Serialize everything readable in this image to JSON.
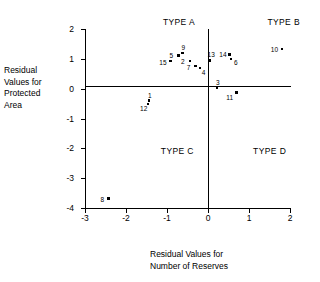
{
  "chart_data": {
    "type": "scatter",
    "title": "",
    "xlabel": "Residual Values for Number of Reserves",
    "xlabel_lines": [
      "Residual Values for",
      "Number of Reserves"
    ],
    "ylabel": "Residual Values for Protected Area",
    "ylabel_lines": [
      "Residual",
      "Values for",
      "Protected",
      "Area"
    ],
    "xlim": [
      -3,
      2
    ],
    "ylim": [
      -4,
      2
    ],
    "xticks": [
      -3,
      -2,
      -1,
      0,
      1,
      2
    ],
    "xtick_labels": [
      "-3",
      "-2",
      "-1",
      "0",
      "1",
      "2"
    ],
    "yticks": [
      -4,
      -3,
      -2,
      -1,
      0,
      1,
      2
    ],
    "ytick_labels": [
      "-4",
      "-3",
      "-2",
      "-1",
      "0",
      "1",
      "2"
    ],
    "grid": false,
    "legend": "none",
    "reference_lines": [
      {
        "axis": "x",
        "value": 0
      },
      {
        "axis": "y",
        "value": 0
      }
    ],
    "annotations": [
      {
        "text": "TYPE A",
        "x": -1.1,
        "y": 2.25
      },
      {
        "text": "TYPE B",
        "x": 1.45,
        "y": 2.25
      },
      {
        "text": "TYPE C",
        "x": -1.15,
        "y": -2.1
      },
      {
        "text": "TYPE D",
        "x": 1.1,
        "y": -2.1
      }
    ],
    "points": [
      {
        "label": "1",
        "x": -1.44,
        "y": -0.4,
        "label_dx": -1,
        "label_dy": -9
      },
      {
        "label": "2",
        "x": -0.44,
        "y": 0.93,
        "label_dx": -9,
        "label_dy": -3
      },
      {
        "label": "3",
        "x": 0.22,
        "y": 0.02,
        "label_dx": -1,
        "label_dy": -9
      },
      {
        "label": "4",
        "x": -0.2,
        "y": 0.69,
        "label_dx": 2,
        "label_dy": 1
      },
      {
        "label": "5",
        "x": -0.72,
        "y": 1.12,
        "label_dx": -9,
        "label_dy": -3
      },
      {
        "label": "6",
        "x": 0.56,
        "y": 1.0,
        "label_dx": 3,
        "label_dy": 0
      },
      {
        "label": "7",
        "x": -0.3,
        "y": 0.76,
        "label_dx": -9,
        "label_dy": -2
      },
      {
        "label": "8",
        "x": -2.43,
        "y": -3.68,
        "label_dx": -8,
        "label_dy": -3
      },
      {
        "label": "9",
        "x": -0.62,
        "y": 1.2,
        "label_dx": -1,
        "label_dy": -9
      },
      {
        "label": "10",
        "x": 1.8,
        "y": 1.33,
        "label_dx": -11,
        "label_dy": -3
      },
      {
        "label": "11",
        "x": 0.69,
        "y": -0.13,
        "label_dx": -10,
        "label_dy": 1
      },
      {
        "label": "12",
        "x": -1.46,
        "y": -0.52,
        "label_dx": -8,
        "label_dy": 1
      },
      {
        "label": "13",
        "x": 0.04,
        "y": 0.95,
        "label_dx": -2,
        "label_dy": -9
      },
      {
        "label": "14",
        "x": 0.52,
        "y": 1.15,
        "label_dx": -10,
        "label_dy": -3
      },
      {
        "label": "15",
        "x": -0.92,
        "y": 0.92,
        "label_dx": -11,
        "label_dy": -2
      }
    ]
  }
}
